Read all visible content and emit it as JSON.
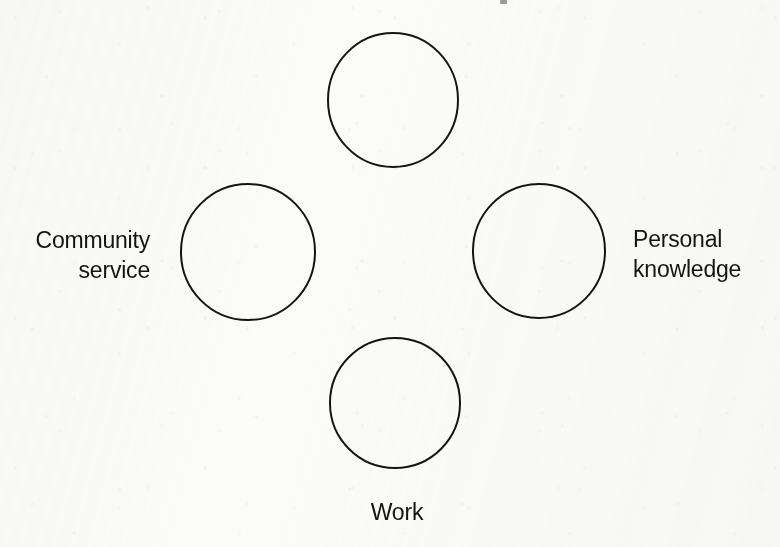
{
  "figure": {
    "background_color": "#fbfbfa",
    "ink_color": "#141414",
    "stroke_width": 2,
    "layout": "diamond",
    "node_count": 4,
    "nodes": [
      {
        "id": "top",
        "shape": "circle",
        "label": "",
        "label_position": "above",
        "label_visible": false,
        "cx": 393,
        "cy": 100,
        "rx": 65,
        "ry": 67
      },
      {
        "id": "left",
        "shape": "circle",
        "label": "Community\nservice",
        "label_position": "left",
        "label_visible": true,
        "cx": 248,
        "cy": 252,
        "rx": 67,
        "ry": 68
      },
      {
        "id": "right",
        "shape": "circle",
        "label": "Personal\nknowledge",
        "label_position": "right",
        "label_visible": true,
        "cx": 539,
        "cy": 251,
        "rx": 66,
        "ry": 67
      },
      {
        "id": "bottom",
        "shape": "circle",
        "label": "Work",
        "label_position": "below",
        "label_visible": true,
        "cx": 395,
        "cy": 403,
        "rx": 65,
        "ry": 65
      }
    ]
  },
  "labels": {
    "left": "Community\nservice",
    "right": "Personal\nknowledge",
    "bottom": "Work"
  }
}
